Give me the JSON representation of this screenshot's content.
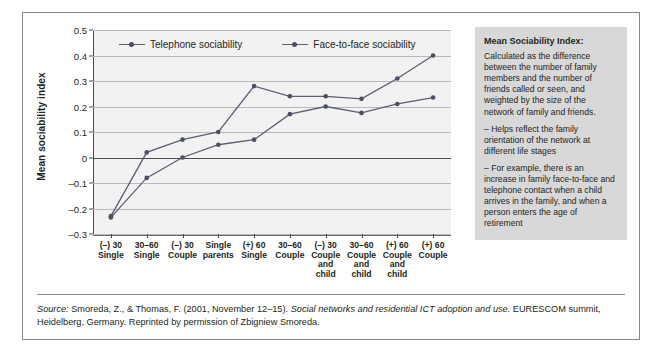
{
  "chart_data": {
    "type": "line",
    "title": "",
    "xlabel": "",
    "ylabel": "Mean sociability index",
    "ylim": [
      -0.3,
      0.5
    ],
    "ytick_labels": [
      "0.5",
      "0.4",
      "0.3",
      "0.2",
      "0.1",
      "0",
      "–0.1",
      "–0.2",
      "–0.3"
    ],
    "ytick_values": [
      0.5,
      0.4,
      0.3,
      0.2,
      0.1,
      0,
      -0.1,
      -0.2,
      -0.3
    ],
    "grid": true,
    "legend_position": "top-inside",
    "categories": [
      "(–) 30\nSingle",
      "30–60\nSingle",
      "(–) 30\nCouple",
      "Single\nparents",
      "(+) 60\nSingle",
      "30–60\nCouple",
      "(–) 30\nCouple\nand\nchild",
      "30–60\nCouple\nand\nchild",
      "(+) 60\nCouple\nand\nchild",
      "(+) 60\nCouple"
    ],
    "series": [
      {
        "name": "Telephone sociability",
        "color": "#5a5f73",
        "values": [
          -0.235,
          -0.08,
          0.0,
          0.05,
          0.07,
          0.17,
          0.2,
          0.175,
          0.21,
          0.235
        ]
      },
      {
        "name": "Face-to-face sociability",
        "color": "#5a5f73",
        "values": [
          -0.23,
          0.02,
          0.07,
          0.1,
          0.28,
          0.24,
          0.24,
          0.23,
          0.31,
          0.4
        ]
      }
    ]
  },
  "note": {
    "heading": "Mean Sociability Index:",
    "paragraphs": [
      "Calculated as the difference between the number of family members and the number of friends called or seen, and weighted by the size of the network of family and friends.",
      "– Helps reflect the family orientation of the network at different life stages",
      "– For example, there is an increase in family face-to-face and telephone contact when a child arrives in the family, and when a person enters the age of retirement"
    ]
  },
  "source": {
    "label": "Source:",
    "authors": " Smoreda, Z., & Thomas, F. (2001, November 12–15). ",
    "work_title": "Social networks and residential ICT adoption and use.",
    "rest": " EURESCOM summit, Heidelberg, Germany. Reprinted by permission of Zbigniew Smoreda."
  }
}
